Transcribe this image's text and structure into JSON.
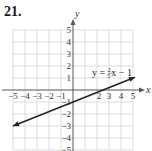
{
  "problem": {
    "number": "21."
  },
  "colors": {
    "grid": "#d4d4d4",
    "axis": "#555555",
    "line": "#222222",
    "text": "#333333"
  },
  "chart_data": {
    "type": "line",
    "title": "",
    "xlabel": "x",
    "ylabel": "y",
    "xlim": [
      -5,
      5
    ],
    "ylim": [
      -5,
      5
    ],
    "grid": true,
    "x_ticks": [
      -5,
      -4,
      -3,
      -2,
      -1,
      2,
      3,
      4,
      5
    ],
    "y_ticks": [
      5,
      4,
      3,
      2,
      1,
      -1,
      -2,
      -3,
      -4,
      -5
    ],
    "x_tick_labels": [
      "−5",
      "−4",
      "−3",
      "−2",
      "−1",
      "2",
      "3",
      "4",
      "5"
    ],
    "y_tick_labels": [
      "5",
      "4",
      "3",
      "2",
      "1",
      "−1",
      "−2",
      "−3",
      "−4",
      "−5"
    ],
    "series": [
      {
        "name": "y = 2/5 x − 1",
        "equation": {
          "lhs": "y =",
          "num": "2",
          "den": "5",
          "rhs": "x − 1"
        },
        "slope": 0.4,
        "intercept": -1,
        "x": [
          -5,
          5
        ],
        "y": [
          -3,
          1
        ],
        "arrows_both_ends": true
      }
    ]
  }
}
